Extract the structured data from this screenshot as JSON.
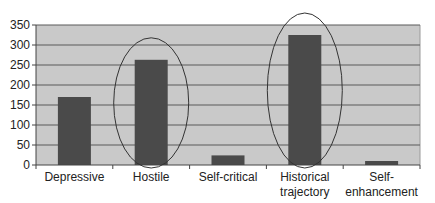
{
  "chart_data": {
    "type": "bar",
    "title": "",
    "xlabel": "",
    "ylabel": "",
    "categories": [
      "Depressive",
      "Hostile",
      "Self-critical",
      "Historical trajectory",
      "Self-enhancement"
    ],
    "category_label_lines": [
      [
        "Depressive"
      ],
      [
        "Hostile"
      ],
      [
        "Self-critical"
      ],
      [
        "Historical",
        "trajectory"
      ],
      [
        "Self-",
        "enhancement"
      ]
    ],
    "values": [
      170,
      263,
      24,
      325,
      10
    ],
    "ylim": [
      0,
      350
    ],
    "yticks": [
      0,
      50,
      100,
      150,
      200,
      250,
      300,
      350
    ],
    "grid": true,
    "legend": null,
    "annotations": [
      {
        "type": "ellipse",
        "target": "Hostile"
      },
      {
        "type": "ellipse",
        "target": "Historical trajectory"
      }
    ],
    "colors": {
      "bar": "#4a4a4a",
      "plot_background": "#c9c9c9",
      "gridline": "#5a5a5a",
      "ellipse": "#333333"
    }
  }
}
